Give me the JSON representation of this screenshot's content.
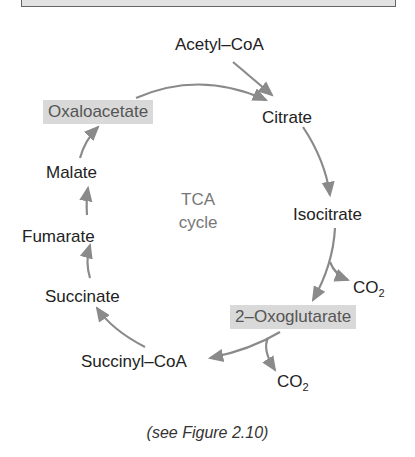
{
  "diagram": {
    "title_center": {
      "line1": "TCA",
      "line2": "cycle"
    },
    "nodes": {
      "acetyl_coa": "Acetyl–CoA",
      "citrate": "Citrate",
      "isocitrate": "Isocitrate",
      "co2_1": "CO",
      "co2_1_sub": "2",
      "oxoglutarate": "2–Oxoglutarate",
      "co2_2": "CO",
      "co2_2_sub": "2",
      "succinyl_coa": "Succinyl–CoA",
      "succinate": "Succinate",
      "fumarate": "Fumarate",
      "malate": "Malate",
      "oxaloacetate": "Oxaloacetate"
    },
    "highlighted_nodes": [
      "Oxaloacetate",
      "2–Oxoglutarate"
    ],
    "arrow_color": "#8a8a8a",
    "highlight_color": "#d9d9d9"
  },
  "caption": "(see Figure 2.10)"
}
